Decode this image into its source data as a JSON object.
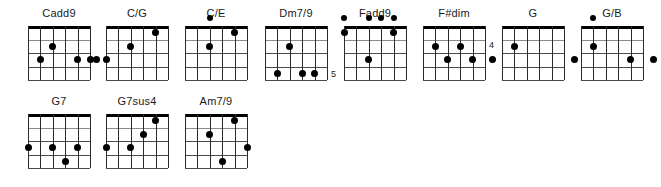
{
  "document": {
    "type": "guitar-chord-chart",
    "strings": 6,
    "frets": 4,
    "ink_color": "#000000",
    "background_color": "#ffffff",
    "grid_line_color": "#8c8c8c",
    "string_line_color": "#2b2b2b"
  },
  "rows": [
    {
      "chords": [
        {
          "name": "Cadd9",
          "x": 20,
          "y": 6,
          "fret_label": "",
          "fret_label_side": "",
          "dots": [
            {
              "string": 5,
              "fret": 2,
              "type": "fretted"
            },
            {
              "string": 4,
              "fret": 1,
              "type": "fretted"
            },
            {
              "string": 2,
              "fret": 2,
              "type": "fretted"
            },
            {
              "string": 1,
              "fret": 2,
              "type": "fretted"
            }
          ]
        },
        {
          "name": "C/G",
          "x": 98,
          "y": 6,
          "fret_label": "",
          "fret_label_side": "",
          "dots": [
            {
              "string": 6,
              "fret": 2,
              "type": "left-outside"
            },
            {
              "string": 6,
              "fret": 2,
              "type": "fretted"
            },
            {
              "string": 4,
              "fret": 1,
              "type": "fretted"
            },
            {
              "string": 2,
              "fret": 0,
              "type": "fretted"
            }
          ]
        },
        {
          "name": "C/E",
          "x": 177,
          "y": 6,
          "fret_label": "",
          "fret_label_side": "",
          "dots": [
            {
              "string": 4,
              "fret": -1,
              "type": "open"
            },
            {
              "string": 2,
              "fret": 0,
              "type": "fretted"
            },
            {
              "string": 4,
              "fret": 1,
              "type": "fretted"
            }
          ]
        },
        {
          "name": "Dm7/9",
          "x": 257,
          "y": 6,
          "fret_label": "5",
          "fret_label_side": "right-bottom",
          "dots": [
            {
              "string": 4,
              "fret": 1,
              "type": "fretted"
            },
            {
              "string": 5,
              "fret": 3,
              "type": "fretted"
            },
            {
              "string": 3,
              "fret": 3,
              "type": "fretted"
            },
            {
              "string": 2,
              "fret": 3,
              "type": "fretted"
            }
          ]
        },
        {
          "name": "Fadd9",
          "x": 336,
          "y": 6,
          "fret_label": "",
          "fret_label_side": "",
          "dots": [
            {
              "string": 6,
              "fret": -1,
              "type": "open"
            },
            {
              "string": 4,
              "fret": -1,
              "type": "open"
            },
            {
              "string": 3,
              "fret": -1,
              "type": "open"
            },
            {
              "string": 2,
              "fret": -1,
              "type": "open"
            },
            {
              "string": 6,
              "fret": 0,
              "type": "fretted"
            },
            {
              "string": 2,
              "fret": 0,
              "type": "fretted"
            },
            {
              "string": 4,
              "fret": 2,
              "type": "fretted"
            }
          ]
        },
        {
          "name": "F#dim",
          "x": 415,
          "y": 6,
          "fret_label": "4",
          "fret_label_side": "right-upper",
          "dots": [
            {
              "string": 5,
              "fret": 1,
              "type": "fretted"
            },
            {
              "string": 3,
              "fret": 1,
              "type": "fretted"
            },
            {
              "string": 4,
              "fret": 2,
              "type": "fretted"
            },
            {
              "string": 2,
              "fret": 2,
              "type": "fretted"
            }
          ]
        },
        {
          "name": "G",
          "x": 494,
          "y": 6,
          "fret_label": "",
          "fret_label_side": "",
          "dots": [
            {
              "string": 6,
              "fret": 2,
              "type": "left-outside"
            },
            {
              "string": 5,
              "fret": 1,
              "type": "fretted"
            },
            {
              "string": 1,
              "fret": 2,
              "type": "right-outside"
            }
          ]
        },
        {
          "name": "G/B",
          "x": 573,
          "y": 6,
          "fret_label": "",
          "fret_label_side": "",
          "dots": [
            {
              "string": 5,
              "fret": -1,
              "type": "open"
            },
            {
              "string": 5,
              "fret": 1,
              "type": "fretted"
            },
            {
              "string": 2,
              "fret": 2,
              "type": "fretted"
            },
            {
              "string": 1,
              "fret": 2,
              "type": "right-outside"
            }
          ]
        }
      ]
    },
    {
      "chords": [
        {
          "name": "G7",
          "x": 20,
          "y": 94,
          "fret_label": "",
          "fret_label_side": "",
          "dots": [
            {
              "string": 6,
              "fret": 2,
              "type": "fretted"
            },
            {
              "string": 4,
              "fret": 2,
              "type": "fretted"
            },
            {
              "string": 2,
              "fret": 2,
              "type": "fretted"
            },
            {
              "string": 3,
              "fret": 3,
              "type": "fretted"
            }
          ]
        },
        {
          "name": "G7sus4",
          "x": 98,
          "y": 94,
          "fret_label": "",
          "fret_label_side": "",
          "dots": [
            {
              "string": 6,
              "fret": 2,
              "type": "fretted"
            },
            {
              "string": 4,
              "fret": 2,
              "type": "fretted"
            },
            {
              "string": 3,
              "fret": 1,
              "type": "fretted"
            },
            {
              "string": 2,
              "fret": 0,
              "type": "fretted"
            }
          ]
        },
        {
          "name": "Am7/9",
          "x": 177,
          "y": 94,
          "fret_label": "",
          "fret_label_side": "",
          "dots": [
            {
              "string": 2,
              "fret": 0,
              "type": "fretted"
            },
            {
              "string": 4,
              "fret": 1,
              "type": "fretted"
            },
            {
              "string": 1,
              "fret": 2,
              "type": "fretted"
            },
            {
              "string": 3,
              "fret": 3,
              "type": "fretted"
            }
          ]
        }
      ]
    }
  ]
}
